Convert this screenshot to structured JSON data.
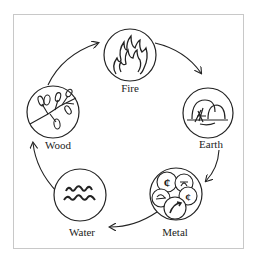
{
  "diagram": {
    "type": "cycle",
    "direction": "clockwise",
    "elements": [
      {
        "name": "Fire",
        "icon": "flame-icon"
      },
      {
        "name": "Earth",
        "icon": "mound-icon"
      },
      {
        "name": "Metal",
        "icon": "coins-icon"
      },
      {
        "name": "Water",
        "icon": "waves-icon"
      },
      {
        "name": "Wood",
        "icon": "branch-icon"
      }
    ],
    "arrows": [
      {
        "from": "Wood",
        "to": "Fire"
      },
      {
        "from": "Fire",
        "to": "Earth"
      },
      {
        "from": "Earth",
        "to": "Metal"
      },
      {
        "from": "Metal",
        "to": "Water"
      },
      {
        "from": "Water",
        "to": "Wood"
      }
    ]
  }
}
